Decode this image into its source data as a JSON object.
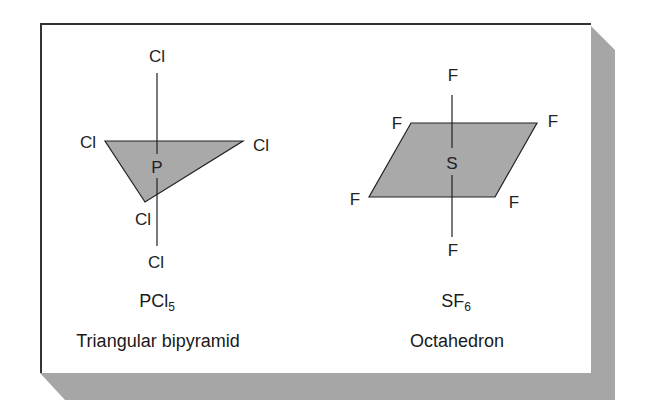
{
  "figure": {
    "colors": {
      "frame": "#333333",
      "fill": "#a9a9a9",
      "shadow": "#a6a6a6",
      "line": "#222222",
      "background": "#ffffff"
    }
  },
  "molecules": [
    {
      "formula": "PCl",
      "formula_subscript": "5",
      "shape_name": "Triangular bipyramid",
      "central_atom": "P",
      "ligands": {
        "top": "Cl",
        "left": "Cl",
        "right": "Cl",
        "front": "Cl",
        "bottom": "Cl"
      }
    },
    {
      "formula": "SF",
      "formula_subscript": "6",
      "shape_name": "Octahedron",
      "central_atom": "S",
      "ligands": {
        "top": "F",
        "back_left": "F",
        "back_right": "F",
        "front_left": "F",
        "front_right": "F",
        "bottom": "F"
      }
    }
  ]
}
